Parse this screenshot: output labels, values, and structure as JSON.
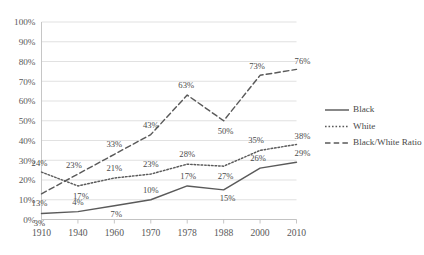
{
  "chart_data": {
    "type": "line",
    "title": "",
    "subtitle": "",
    "xlabel": "",
    "ylabel": "",
    "categories": [
      "1910",
      "1940",
      "1960",
      "1970",
      "1978",
      "1988",
      "2000",
      "2010"
    ],
    "ylim": [
      0,
      100
    ],
    "ytick_labels": [
      "0%",
      "10%",
      "20%",
      "30%",
      "40%",
      "50%",
      "60%",
      "70%",
      "80%",
      "90%",
      "100%"
    ],
    "ytick_values": [
      0,
      10,
      20,
      30,
      40,
      50,
      60,
      70,
      80,
      90,
      100
    ],
    "grid": true,
    "grid_axis": "y",
    "legend_position": "right",
    "series": [
      {
        "name": "Black",
        "style": "solid",
        "color": "#5a5a5a",
        "values": [
          3,
          4,
          7,
          10,
          17,
          15,
          26,
          29
        ],
        "labels": [
          "3%",
          "4%",
          "7%",
          "10%",
          "17%",
          "15%",
          "26%",
          "29%"
        ]
      },
      {
        "name": "White",
        "style": "dotted",
        "color": "#5a5a5a",
        "values": [
          24,
          17,
          21,
          23,
          28,
          27,
          35,
          38
        ],
        "labels": [
          "24%",
          "17%",
          "21%",
          "23%",
          "28%",
          "27%",
          "35%",
          "38%"
        ]
      },
      {
        "name": "Black/White Ratio",
        "style": "dashed",
        "color": "#5a5a5a",
        "values": [
          13,
          23,
          33,
          43,
          63,
          50,
          73,
          76
        ],
        "labels": [
          "13%",
          "23%",
          "33%",
          "43%",
          "63%",
          "50%",
          "73%",
          "76%"
        ]
      }
    ]
  },
  "legend": {
    "items": [
      {
        "label": "Black"
      },
      {
        "label": "White"
      },
      {
        "label": "Black/White Ratio"
      }
    ]
  }
}
